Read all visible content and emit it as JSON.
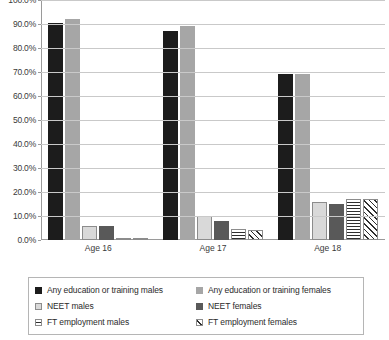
{
  "chart_data": {
    "type": "bar",
    "title": "",
    "subtitle": "",
    "xlabel": "",
    "ylabel": "",
    "categories": [
      "Age 16",
      "Age 17",
      "Age 18"
    ],
    "ylim": [
      0,
      100
    ],
    "ytick_labels": [
      "0.0%",
      "10.0%",
      "20.0%",
      "30.0%",
      "40.0%",
      "50.0%",
      "60.0%",
      "70.0%",
      "80.0%",
      "90.0%",
      "100.0%"
    ],
    "ytick_values": [
      0,
      10,
      20,
      30,
      40,
      50,
      60,
      70,
      80,
      90,
      100
    ],
    "grid": true,
    "grid_axis": "y",
    "legend_position": "bottom",
    "legend_columns": 2,
    "units": "percent",
    "series": [
      {
        "name": "Any education or training males",
        "values": [
          90.5,
          87.0,
          69.0
        ],
        "fill": "solid-black",
        "color": "#1c1c1c"
      },
      {
        "name": "Any education or training females",
        "values": [
          92.0,
          89.0,
          69.0
        ],
        "fill": "solid-medium-gray",
        "color": "#a6a6a6"
      },
      {
        "name": "NEET males",
        "values": [
          6.0,
          10.0,
          16.0
        ],
        "fill": "solid-light-gray",
        "color": "#d9d9d9"
      },
      {
        "name": "NEET females",
        "values": [
          6.0,
          8.0,
          15.0
        ],
        "fill": "solid-dark-gray",
        "color": "#595959"
      },
      {
        "name": "FT employment males",
        "values": [
          1.0,
          4.5,
          17.0
        ],
        "fill": "horizontal-lines",
        "color": "#2f2f2f"
      },
      {
        "name": "FT employment females",
        "values": [
          1.0,
          4.0,
          17.0
        ],
        "fill": "diagonal-hatch",
        "color": "#2f2f2f"
      }
    ]
  },
  "legend": {
    "items": [
      {
        "label": "Any education or training males"
      },
      {
        "label": "Any education or training females"
      },
      {
        "label": "NEET males"
      },
      {
        "label": "NEET females"
      },
      {
        "label": "FT employment males"
      },
      {
        "label": "FT employment females"
      }
    ]
  }
}
